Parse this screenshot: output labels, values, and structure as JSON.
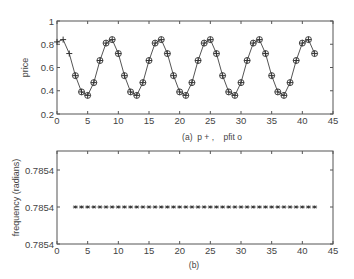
{
  "chart_data": [
    {
      "id": "a",
      "type": "line",
      "caption": "(a)  p + ,    pfit o",
      "title": "",
      "xlabel": "",
      "ylabel": "price",
      "xlim": [
        0,
        45
      ],
      "ylim": [
        0.2,
        1.0
      ],
      "xticks": [
        0,
        5,
        10,
        15,
        20,
        25,
        30,
        35,
        40,
        45
      ],
      "xtick_labels": [
        "0",
        "5",
        "10",
        "15",
        "20",
        "25",
        "30",
        "35",
        "40",
        "45"
      ],
      "yticks": [
        0.2,
        0.4,
        0.6,
        0.8,
        1.0
      ],
      "ytick_labels": [
        "0.2",
        "0.4",
        "0.6",
        "0.8",
        "1"
      ],
      "grid": false,
      "legend": "caption",
      "series": [
        {
          "name": "p",
          "marker": "+",
          "line": true,
          "x": [
            0,
            1,
            2,
            3,
            4,
            5,
            6,
            7,
            8,
            9,
            10,
            11,
            12,
            13,
            14,
            15,
            16,
            17,
            18,
            19,
            20,
            21,
            22,
            23,
            24,
            25,
            26,
            27,
            28,
            29,
            30,
            31,
            32,
            33,
            34,
            35,
            36,
            37,
            38,
            39,
            40,
            41,
            42
          ],
          "values": [
            0.82,
            0.84,
            0.72,
            0.53,
            0.39,
            0.36,
            0.47,
            0.66,
            0.81,
            0.84,
            0.72,
            0.53,
            0.39,
            0.36,
            0.47,
            0.66,
            0.81,
            0.84,
            0.72,
            0.53,
            0.39,
            0.36,
            0.47,
            0.66,
            0.81,
            0.84,
            0.72,
            0.53,
            0.39,
            0.36,
            0.47,
            0.66,
            0.81,
            0.84,
            0.72,
            0.53,
            0.39,
            0.36,
            0.47,
            0.66,
            0.81,
            0.84,
            0.72
          ]
        },
        {
          "name": "pfit",
          "marker": "o",
          "line": false,
          "x": [
            3,
            4,
            5,
            6,
            7,
            8,
            9,
            10,
            11,
            12,
            13,
            14,
            15,
            16,
            17,
            18,
            19,
            20,
            21,
            22,
            23,
            24,
            25,
            26,
            27,
            28,
            29,
            30,
            31,
            32,
            33,
            34,
            35,
            36,
            37,
            38,
            39,
            40,
            41,
            42
          ],
          "values": [
            0.53,
            0.39,
            0.36,
            0.47,
            0.66,
            0.81,
            0.84,
            0.72,
            0.53,
            0.39,
            0.36,
            0.47,
            0.66,
            0.81,
            0.84,
            0.72,
            0.53,
            0.39,
            0.36,
            0.47,
            0.66,
            0.81,
            0.84,
            0.72,
            0.53,
            0.39,
            0.36,
            0.47,
            0.66,
            0.81,
            0.84,
            0.72,
            0.53,
            0.39,
            0.36,
            0.47,
            0.66,
            0.81,
            0.84,
            0.72
          ]
        }
      ]
    },
    {
      "id": "b",
      "type": "scatter",
      "caption": "(b)",
      "title": "",
      "xlabel": "",
      "ylabel": "frequency (radians)",
      "xlim": [
        0,
        45
      ],
      "ylim": [
        0.7854,
        0.7854
      ],
      "xticks": [
        0,
        5,
        10,
        15,
        20,
        25,
        30,
        35,
        40,
        45
      ],
      "xtick_labels": [
        "0",
        "5",
        "10",
        "15",
        "20",
        "25",
        "30",
        "35",
        "40",
        "45"
      ],
      "ytick_labels": [
        "0.7854",
        "0.7854",
        "0.7854"
      ],
      "grid": false,
      "series": [
        {
          "name": "frequency",
          "marker": "*",
          "line": false,
          "x": [
            3,
            4,
            5,
            6,
            7,
            8,
            9,
            10,
            11,
            12,
            13,
            14,
            15,
            16,
            17,
            18,
            19,
            20,
            21,
            22,
            23,
            24,
            25,
            26,
            27,
            28,
            29,
            30,
            31,
            32,
            33,
            34,
            35,
            36,
            37,
            38,
            39,
            40,
            41,
            42
          ],
          "values": [
            0.7854,
            0.7854,
            0.7854,
            0.7854,
            0.7854,
            0.7854,
            0.7854,
            0.7854,
            0.7854,
            0.7854,
            0.7854,
            0.7854,
            0.7854,
            0.7854,
            0.7854,
            0.7854,
            0.7854,
            0.7854,
            0.7854,
            0.7854,
            0.7854,
            0.7854,
            0.7854,
            0.7854,
            0.7854,
            0.7854,
            0.7854,
            0.7854,
            0.7854,
            0.7854,
            0.7854,
            0.7854,
            0.7854,
            0.7854,
            0.7854,
            0.7854,
            0.7854,
            0.7854,
            0.7854,
            0.7854
          ]
        }
      ]
    }
  ],
  "colors": {
    "axis": "#555555",
    "line": "#555555",
    "marker": "#333333",
    "text": "#444444",
    "background": "#ffffff"
  }
}
